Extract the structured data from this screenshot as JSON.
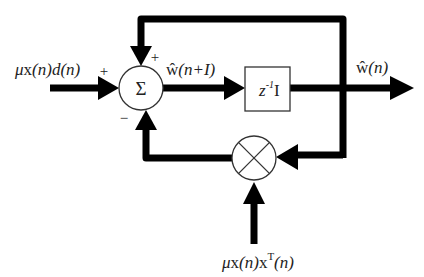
{
  "diagram": {
    "type": "block-diagram",
    "colors": {
      "line": "#000000",
      "text": "#222222",
      "background": "#ffffff",
      "block_stroke": "#333333"
    },
    "blocks": {
      "summer": {
        "symbol": "Σ",
        "label": "summing junction"
      },
      "delay": {
        "label_main": "z",
        "label_sup": "-1",
        "label_tail": "I"
      },
      "multiplier": {
        "symbol": "×",
        "label": "multiplier"
      }
    },
    "signals": {
      "input_left": {
        "mu": "μ",
        "x": "x",
        "n1": "(n)",
        "d": "d",
        "n2": "(n)"
      },
      "summer_output": {
        "w": "ŵ",
        "arg": "(n+",
        "I": "I",
        "close": ")"
      },
      "output": {
        "w": "ŵ",
        "arg": "(n)"
      },
      "input_bottom": {
        "mu": "μ",
        "x": "x",
        "n1": "(n)",
        "x2": "x",
        "T": "T",
        "n2": "(n)"
      }
    },
    "signs": {
      "left_input": "+",
      "top_feedback": "+",
      "bottom_feedback": "−"
    }
  }
}
